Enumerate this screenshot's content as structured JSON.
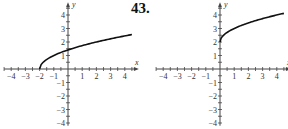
{
  "problem_number": "43.",
  "chart_data": [
    {
      "type": "line",
      "title": "",
      "xlabel": "x",
      "ylabel": "y",
      "xlim": [
        -4.5,
        4.5
      ],
      "ylim": [
        -4.2,
        4.5
      ],
      "grid": false,
      "x_ticks": [
        -4,
        -3,
        -2,
        -1,
        1,
        2,
        3,
        4
      ],
      "y_ticks": [
        -4,
        -3,
        -2,
        -1,
        1,
        2,
        3,
        4
      ],
      "series": [
        {
          "name": "y = sqrt(x + 2)",
          "x": [
            -2,
            -1.5,
            -1,
            0,
            1,
            2,
            3,
            4,
            4.5
          ],
          "y": [
            0,
            0.71,
            1,
            1.41,
            1.73,
            2,
            2.24,
            2.45,
            2.55
          ]
        }
      ]
    },
    {
      "type": "line",
      "title": "",
      "xlabel": "x",
      "ylabel": "y",
      "xlim": [
        -4.5,
        4.5
      ],
      "ylim": [
        -4.2,
        4.5
      ],
      "grid": false,
      "x_ticks": [
        -4,
        -3,
        -2,
        -1,
        1,
        2,
        3,
        4
      ],
      "y_ticks": [
        -4,
        -3,
        -2,
        -1,
        1,
        2,
        3,
        4
      ],
      "series": [
        {
          "name": "y = sqrt(x) + 2",
          "x": [
            0,
            0.5,
            1,
            2,
            3,
            4,
            4.5
          ],
          "y": [
            2,
            2.71,
            3,
            3.41,
            3.73,
            4,
            4.12
          ]
        }
      ]
    }
  ]
}
